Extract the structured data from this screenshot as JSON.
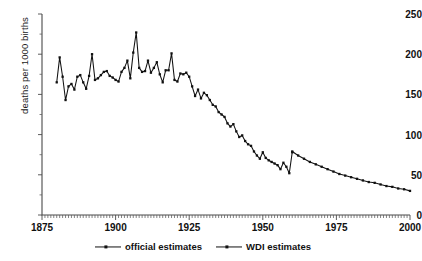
{
  "chart_data": {
    "type": "line",
    "title": "",
    "xlabel": "",
    "ylabel": "deaths per 1000 births",
    "xlim": [
      1875,
      2000
    ],
    "ylim": [
      0,
      250
    ],
    "yticks": [
      0,
      50,
      100,
      150,
      200,
      250
    ],
    "xticks": [
      1875,
      1900,
      1925,
      1950,
      1975,
      2000
    ],
    "grid": false,
    "legend_position": "bottom-center",
    "minor_tick_interval": 1,
    "series": [
      {
        "name": "official estimates",
        "x": [
          1880,
          1881,
          1882,
          1883,
          1884,
          1885,
          1886,
          1887,
          1888,
          1889,
          1890,
          1891,
          1892,
          1893,
          1894,
          1895,
          1896,
          1897,
          1898,
          1899,
          1900,
          1901,
          1902,
          1903,
          1904,
          1905,
          1906,
          1907,
          1908,
          1909,
          1910,
          1911,
          1912,
          1913,
          1914,
          1915,
          1916,
          1917,
          1918,
          1919,
          1920,
          1921,
          1922,
          1923,
          1924,
          1925,
          1926,
          1927,
          1928,
          1929,
          1930,
          1931,
          1932,
          1933,
          1934,
          1935,
          1936,
          1937,
          1938,
          1939,
          1940,
          1941,
          1942,
          1943,
          1944,
          1945,
          1946,
          1947,
          1948,
          1949,
          1950,
          1951,
          1952,
          1953,
          1954,
          1955,
          1956,
          1957,
          1958,
          1959,
          1960
        ],
        "y": [
          165,
          196,
          172,
          143,
          160,
          163,
          156,
          172,
          174,
          165,
          157,
          173,
          200,
          168,
          170,
          174,
          178,
          179,
          173,
          171,
          168,
          166,
          178,
          183,
          192,
          170,
          202,
          227,
          183,
          178,
          179,
          192,
          177,
          183,
          190,
          175,
          165,
          180,
          180,
          201,
          168,
          166,
          176,
          175,
          177,
          172,
          160,
          148,
          156,
          145,
          152,
          149,
          143,
          137,
          135,
          128,
          125,
          122,
          114,
          110,
          113,
          104,
          97,
          99,
          92,
          88,
          86,
          79,
          74,
          70,
          78,
          71,
          68,
          66,
          64,
          62,
          57,
          65,
          60,
          52,
          78
        ]
      },
      {
        "name": "WDI estimates",
        "x": [
          1960,
          1962,
          1964,
          1966,
          1968,
          1970,
          1972,
          1974,
          1976,
          1978,
          1980,
          1982,
          1984,
          1986,
          1988,
          1990,
          1992,
          1994,
          1996,
          1998,
          2000
        ],
        "y": [
          79,
          74,
          70,
          66,
          63,
          60,
          57,
          54,
          51,
          49,
          47,
          45,
          43,
          41,
          40,
          38,
          36,
          35,
          33,
          32,
          30
        ]
      }
    ]
  },
  "legend": {
    "entries": [
      {
        "label": "official estimates"
      },
      {
        "label": "WDI estimates"
      }
    ]
  },
  "colors": {
    "line": "#111111",
    "axis": "#4a4a4a",
    "background": "#ffffff"
  }
}
